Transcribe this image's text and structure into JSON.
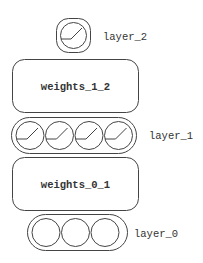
{
  "diagram": {
    "layers": [
      {
        "name": "layer_2",
        "units": 1,
        "activation_glyph": true
      },
      {
        "name": "layer_1",
        "units": 4,
        "activation_glyph": true
      },
      {
        "name": "layer_0",
        "units": 3,
        "activation_glyph": false
      }
    ],
    "weights": [
      {
        "name": "weights_1_2"
      },
      {
        "name": "weights_0_1"
      }
    ]
  },
  "colors": {
    "stroke": "#444444",
    "text": "#333333",
    "background": "#ffffff"
  }
}
